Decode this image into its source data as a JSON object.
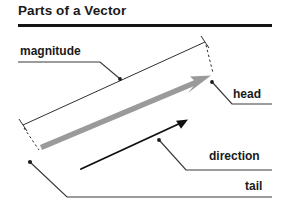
{
  "page": {
    "title": "Parts of a Vector",
    "background_color": "#ffffff",
    "width": 284,
    "height": 202
  },
  "rule": {
    "name": "title-underline",
    "color": "#1a1a1a"
  },
  "diagram": {
    "type": "vector-anatomy-diagram",
    "vector_arrow": {
      "name": "vector-arrow",
      "color": "#9a9a9a",
      "tail_point": [
        41,
        147
      ],
      "head_point": [
        210,
        76
      ]
    },
    "direction_arrow": {
      "name": "direction-arrow",
      "color": "#101010",
      "start_point": [
        81,
        169
      ],
      "end_point": [
        187,
        120
      ]
    },
    "magnitude_measure": {
      "name": "magnitude-measure-line",
      "color": "#2a2a2a",
      "start_point": [
        23,
        125
      ],
      "end_point": [
        205,
        42
      ]
    }
  },
  "labels": {
    "magnitude": "magnitude",
    "head": "head",
    "direction": "direction",
    "tail": "tail"
  },
  "colors": {
    "ink": "#1a1a1a",
    "vector_gray": "#9a9a9a",
    "leader_line": "#3a3a3a"
  }
}
